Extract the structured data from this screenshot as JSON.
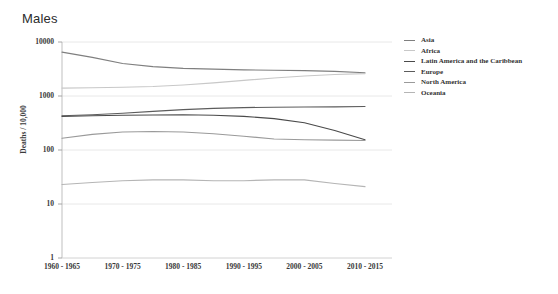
{
  "chart_data": {
    "type": "line",
    "title": "Males",
    "xlabel": "",
    "ylabel": "Deaths / 10,000",
    "grid": true,
    "legend_position": "right",
    "yscale": "log",
    "ylim": [
      1,
      10000
    ],
    "y_ticks": [
      "10000",
      "1000",
      "100",
      "10",
      "1"
    ],
    "categories": [
      "1960 - 1965",
      "1965 - 1970",
      "1970 - 1975",
      "1975 - 1980",
      "1980 - 1985",
      "1985 - 1990",
      "1990 - 1995",
      "1995 - 2000",
      "2000 - 2005",
      "2005 - 2010",
      "2010 - 2015"
    ],
    "x_tick_labels": [
      "1960 - 1965",
      "1970 - 1975",
      "1980 - 1985",
      "1990 - 1995",
      "2000 - 2005",
      "2010 - 2015"
    ],
    "series": [
      {
        "name": "Asia",
        "color": "#7f7f7f",
        "values": [
          6500,
          5200,
          4000,
          3500,
          3250,
          3150,
          3050,
          3000,
          2950,
          2850,
          2700
        ]
      },
      {
        "name": "Africa",
        "color": "#c8c8c8",
        "values": [
          1400,
          1420,
          1450,
          1500,
          1600,
          1750,
          1950,
          2150,
          2350,
          2500,
          2600
        ]
      },
      {
        "name": "Latin America and the Caribbean",
        "color": "#4a4a4a",
        "values": [
          420,
          430,
          440,
          445,
          450,
          440,
          420,
          380,
          320,
          230,
          155
        ]
      },
      {
        "name": "Europe",
        "color": "#5c5c5c",
        "values": [
          430,
          450,
          480,
          520,
          560,
          590,
          610,
          620,
          625,
          630,
          640
        ]
      },
      {
        "name": "North America",
        "color": "#9a9a9a",
        "values": [
          165,
          195,
          215,
          220,
          215,
          200,
          180,
          160,
          155,
          152,
          150
        ]
      },
      {
        "name": "Oceania",
        "color": "#b5b5b5",
        "values": [
          23,
          25,
          27,
          28,
          28,
          27,
          27,
          28,
          28,
          24,
          21
        ]
      }
    ]
  },
  "legend": {
    "items": [
      {
        "label": "Asia",
        "color": "#7f7f7f"
      },
      {
        "label": "Africa",
        "color": "#c8c8c8"
      },
      {
        "label": "Latin America and the Caribbean",
        "color": "#4a4a4a"
      },
      {
        "label": "Europe",
        "color": "#5c5c5c"
      },
      {
        "label": "North America",
        "color": "#9a9a9a"
      },
      {
        "label": "Oceania",
        "color": "#b5b5b5"
      }
    ]
  },
  "axes": {
    "y_title": "Deaths / 10,000"
  }
}
